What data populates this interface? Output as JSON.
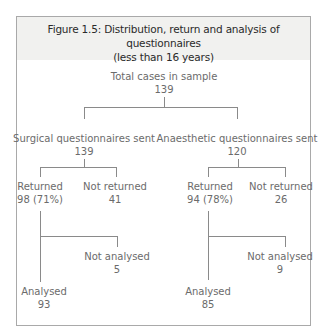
{
  "figure": {
    "title_line1": "Figure 1.5: Distribution, return and analysis of questionnaires",
    "title_line2": "(less than 16 years)"
  },
  "root": {
    "label": "Total cases in sample",
    "value": "139"
  },
  "surgical": {
    "label": "Surgical questionnaires sent",
    "value": "139",
    "returned": {
      "label": "Returned",
      "value": "98 (71%)"
    },
    "not_returned": {
      "label": "Not returned",
      "value": "41"
    },
    "analysed": {
      "label": "Analysed",
      "value": "93"
    },
    "not_analysed": {
      "label": "Not analysed",
      "value": "5"
    }
  },
  "anaesthetic": {
    "label": "Anaesthetic questionnaires sent",
    "value": "120",
    "returned": {
      "label": "Returned",
      "value": "94 (78%)"
    },
    "not_returned": {
      "label": "Not returned",
      "value": "26"
    },
    "analysed": {
      "label": "Analysed",
      "value": "85"
    },
    "not_analysed": {
      "label": "Not analysed",
      "value": "9"
    }
  }
}
